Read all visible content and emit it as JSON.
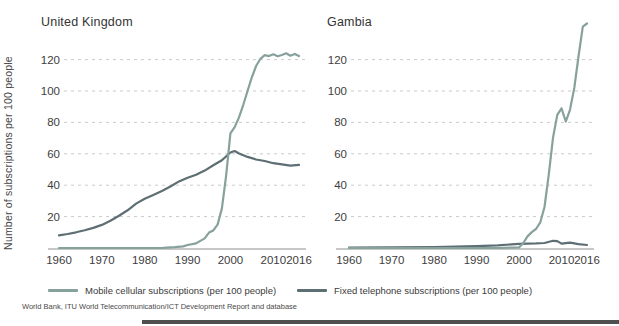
{
  "source_note": "World Bank, ITU World Telecommunication/ICT Development Report and database",
  "colors": {
    "mobile_line": "#87a19d",
    "fixed_line": "#5d6e74",
    "gridline": "#cbcbcb",
    "axis_line": "#b5b5b5",
    "text": "#3d3d3d",
    "bottom_bar": "#4f4f4f"
  },
  "chart_data": [
    {
      "type": "line",
      "title": "United Kingdom",
      "xlabel": "",
      "ylabel": "Number of subscriptions per 100 people",
      "xlim": [
        1960,
        2016
      ],
      "ylim": [
        0,
        145
      ],
      "x_ticks": [
        1960,
        1970,
        1980,
        1990,
        2000,
        2010,
        2016
      ],
      "y_ticks": [
        20,
        40,
        60,
        80,
        100,
        120
      ],
      "grid": "horizontal-dashed",
      "legend_position": "bottom",
      "series": [
        {
          "name": "Mobile cellular subscriptions (per 100 people)",
          "color": "#87a19d",
          "points": [
            [
              1960,
              0
            ],
            [
              1984,
              0
            ],
            [
              1985,
              0.2
            ],
            [
              1987,
              0.5
            ],
            [
              1989,
              1.0
            ],
            [
              1990,
              1.9
            ],
            [
              1992,
              2.9
            ],
            [
              1994,
              6.1
            ],
            [
              1995,
              9.8
            ],
            [
              1996,
              11.2
            ],
            [
              1997,
              14.9
            ],
            [
              1998,
              25.2
            ],
            [
              1999,
              46.0
            ],
            [
              2000,
              73.0
            ],
            [
              2001,
              77.0
            ],
            [
              2002,
              83.2
            ],
            [
              2003,
              91.2
            ],
            [
              2004,
              100.1
            ],
            [
              2005,
              108.8
            ],
            [
              2006,
              115.9
            ],
            [
              2007,
              120.5
            ],
            [
              2008,
              122.8
            ],
            [
              2009,
              122.2
            ],
            [
              2010,
              123.4
            ],
            [
              2011,
              122.1
            ],
            [
              2012,
              122.9
            ],
            [
              2013,
              124.0
            ],
            [
              2014,
              122.5
            ],
            [
              2015,
              123.6
            ],
            [
              2016,
              122.2
            ]
          ]
        },
        {
          "name": "Fixed telephone subscriptions (per 100 people)",
          "color": "#5d6e74",
          "points": [
            [
              1960,
              8.1
            ],
            [
              1962,
              8.9
            ],
            [
              1964,
              10.0
            ],
            [
              1966,
              11.3
            ],
            [
              1968,
              12.8
            ],
            [
              1970,
              14.7
            ],
            [
              1972,
              17.3
            ],
            [
              1974,
              20.6
            ],
            [
              1976,
              24.0
            ],
            [
              1978,
              28.3
            ],
            [
              1980,
              31.4
            ],
            [
              1982,
              33.8
            ],
            [
              1984,
              36.3
            ],
            [
              1986,
              39.2
            ],
            [
              1988,
              42.4
            ],
            [
              1990,
              44.7
            ],
            [
              1992,
              46.6
            ],
            [
              1994,
              49.3
            ],
            [
              1996,
              52.7
            ],
            [
              1998,
              55.9
            ],
            [
              2000,
              60.8
            ],
            [
              2001,
              61.8
            ],
            [
              2002,
              60.2
            ],
            [
              2004,
              58.0
            ],
            [
              2006,
              56.4
            ],
            [
              2008,
              55.4
            ],
            [
              2010,
              54.0
            ],
            [
              2012,
              53.3
            ],
            [
              2014,
              52.4
            ],
            [
              2016,
              53.0
            ]
          ]
        }
      ]
    },
    {
      "type": "line",
      "title": "Gambia",
      "xlabel": "",
      "ylabel": "",
      "xlim": [
        1960,
        2016
      ],
      "ylim": [
        0,
        145
      ],
      "x_ticks": [
        1960,
        1970,
        1980,
        1990,
        2000,
        2010,
        2016
      ],
      "y_ticks": [
        20,
        40,
        60,
        80,
        100,
        120
      ],
      "grid": "horizontal-dashed",
      "legend_position": "bottom",
      "series": [
        {
          "name": "Mobile cellular subscriptions (per 100 people)",
          "color": "#87a19d",
          "points": [
            [
              1960,
              0
            ],
            [
              1995,
              0
            ],
            [
              1998,
              0.2
            ],
            [
              2000,
              0.4
            ],
            [
              2001,
              3.2
            ],
            [
              2002,
              7.4
            ],
            [
              2003,
              10.1
            ],
            [
              2004,
              12.1
            ],
            [
              2005,
              16.4
            ],
            [
              2006,
              26.1
            ],
            [
              2007,
              46.9
            ],
            [
              2008,
              70.2
            ],
            [
              2009,
              84.8
            ],
            [
              2010,
              89.0
            ],
            [
              2011,
              80.6
            ],
            [
              2012,
              88.0
            ],
            [
              2013,
              102.0
            ],
            [
              2014,
              122.0
            ],
            [
              2015,
              141.0
            ],
            [
              2016,
              143.0
            ]
          ]
        },
        {
          "name": "Fixed telephone subscriptions (per 100 people)",
          "color": "#5d6e74",
          "points": [
            [
              1960,
              0.3
            ],
            [
              1970,
              0.4
            ],
            [
              1980,
              0.6
            ],
            [
              1985,
              0.8
            ],
            [
              1990,
              1.2
            ],
            [
              1995,
              1.7
            ],
            [
              2000,
              2.6
            ],
            [
              2002,
              2.8
            ],
            [
              2004,
              2.9
            ],
            [
              2006,
              3.2
            ],
            [
              2008,
              4.6
            ],
            [
              2009,
              4.4
            ],
            [
              2010,
              2.8
            ],
            [
              2012,
              3.4
            ],
            [
              2014,
              2.4
            ],
            [
              2016,
              1.9
            ]
          ]
        }
      ]
    }
  ]
}
